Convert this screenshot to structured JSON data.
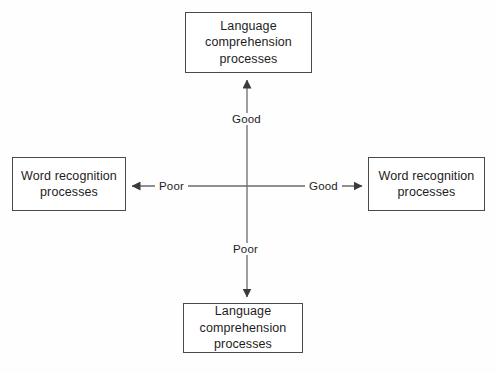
{
  "diagram": {
    "background_color": "#fefefe",
    "line_color": "#555555",
    "box_border_color": "#4a4a4a",
    "text_color": "#1d1d1d",
    "nodes": {
      "top": {
        "label": "Language\ncomprehension\nprocesses"
      },
      "bottom": {
        "label": "Language\ncomprehension\nprocesses"
      },
      "left": {
        "label": "Word recognition\nprocesses"
      },
      "right": {
        "label": "Word recognition\nprocesses"
      }
    },
    "axis_labels": {
      "up": "Good",
      "down": "Poor",
      "left": "Poor",
      "right": "Good"
    },
    "axes": {
      "center_x": 247,
      "center_y": 186,
      "vertical_top_y": 76,
      "vertical_bottom_y": 301,
      "horizontal_left_x": 128,
      "horizontal_right_x": 366
    }
  }
}
